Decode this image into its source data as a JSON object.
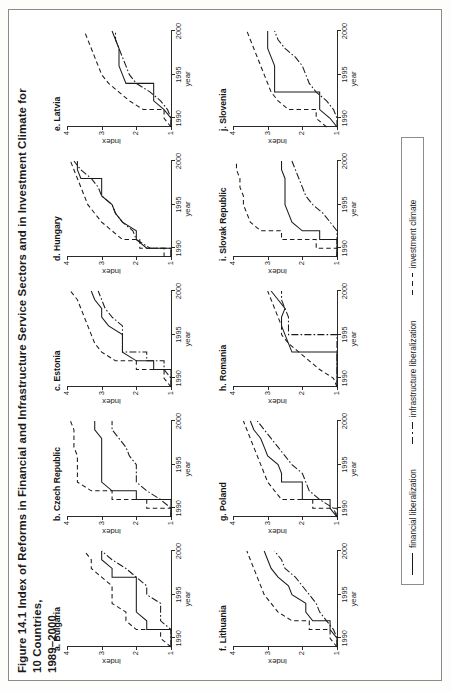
{
  "figure": {
    "title_line1": "Figure 14.1  Index of Reforms in Financial and Infrastructure Service Sectors and in Investment Climate for 10 Countries,",
    "title_line2": "1989–2000"
  },
  "legend": {
    "items": [
      {
        "label": "financial liberalization",
        "style": "solid",
        "icon": "line-solid-icon"
      },
      {
        "label": "infrastructure liberalization",
        "style": "dashdot",
        "icon": "line-dashdot-icon"
      },
      {
        "label": "investment climate",
        "style": "dash",
        "icon": "line-dashed-icon"
      }
    ]
  },
  "chart_data": {
    "type": "line",
    "title": "Figure 14.1  Index of Reforms in Financial and Infrastructure Service Sectors and in Investment Climate for 10 Countries, 1989–2000",
    "xlabel": "year",
    "ylabel": "index",
    "xlim": [
      1989,
      2000
    ],
    "ylim": [
      1,
      4
    ],
    "xticks": [
      1990,
      1995,
      2000
    ],
    "xtick_labels": [
      "1990",
      "1995",
      "2000"
    ],
    "yticks": [
      1,
      2,
      3,
      4
    ],
    "ytick_labels": [
      "1",
      "2",
      "3",
      "4"
    ],
    "grid": false,
    "legend_position": "bottom",
    "x": [
      1989,
      1990,
      1991,
      1992,
      1993,
      1994,
      1995,
      1996,
      1997,
      1998,
      1999,
      2000
    ],
    "panels": [
      {
        "key": "a",
        "label": "a. Bulgaria",
        "series": [
          {
            "name": "financial liberalization",
            "style": "solid",
            "values": [
              1.0,
              1.0,
              1.7,
              1.7,
              2.0,
              2.0,
              2.0,
              2.0,
              2.7,
              2.7,
              3.0,
              3.0
            ]
          },
          {
            "name": "infrastructure liberalization",
            "style": "dashdot",
            "values": [
              1.0,
              1.0,
              1.0,
              1.3,
              1.3,
              1.3,
              1.7,
              1.7,
              2.0,
              2.3,
              2.7,
              3.0
            ]
          },
          {
            "name": "investment climate",
            "style": "dash",
            "values": [
              1.0,
              1.3,
              2.0,
              2.3,
              2.3,
              2.7,
              2.7,
              2.7,
              3.0,
              3.3,
              3.3,
              3.5
            ]
          }
        ]
      },
      {
        "key": "b",
        "label": "b. Czech Republic",
        "series": [
          {
            "name": "financial liberalization",
            "style": "solid",
            "values": [
              1.0,
              1.0,
              2.0,
              2.7,
              3.0,
              3.0,
              3.0,
              3.0,
              3.0,
              3.0,
              3.2,
              3.2
            ]
          },
          {
            "name": "infrastructure liberalization",
            "style": "dashdot",
            "values": [
              1.0,
              1.0,
              1.3,
              1.7,
              2.0,
              2.0,
              2.0,
              2.2,
              2.3,
              2.5,
              2.7,
              2.7
            ]
          },
          {
            "name": "investment climate",
            "style": "dash",
            "values": [
              1.0,
              1.7,
              2.7,
              3.3,
              3.7,
              3.7,
              3.7,
              3.7,
              3.8,
              3.8,
              3.8,
              3.9
            ]
          }
        ]
      },
      {
        "key": "c",
        "label": "c. Estonia",
        "series": [
          {
            "name": "financial liberalization",
            "style": "solid",
            "values": [
              1.0,
              1.0,
              1.5,
              2.0,
              2.4,
              2.4,
              2.4,
              2.8,
              3.0,
              3.0,
              3.2,
              3.3
            ]
          },
          {
            "name": "infrastructure liberalization",
            "style": "dashdot",
            "values": [
              1.0,
              1.0,
              1.2,
              1.7,
              2.4,
              2.4,
              2.4,
              2.4,
              2.7,
              2.9,
              3.0,
              3.1
            ]
          },
          {
            "name": "investment climate",
            "style": "dash",
            "values": [
              1.0,
              1.2,
              2.0,
              2.6,
              3.0,
              3.2,
              3.3,
              3.4,
              3.5,
              3.6,
              3.7,
              3.9
            ]
          }
        ]
      },
      {
        "key": "d",
        "label": "d. Hungary",
        "series": [
          {
            "name": "financial liberalization",
            "style": "solid",
            "values": [
              1.0,
              1.7,
              2.0,
              2.0,
              2.4,
              2.6,
              2.7,
              3.0,
              3.0,
              3.6,
              3.7,
              3.7
            ]
          },
          {
            "name": "infrastructure liberalization",
            "style": "dashdot",
            "values": [
              1.0,
              1.6,
              2.0,
              2.1,
              2.4,
              2.6,
              2.7,
              3.0,
              3.1,
              3.3,
              3.6,
              3.8
            ]
          },
          {
            "name": "investment climate",
            "style": "dash",
            "values": [
              1.2,
              1.9,
              2.4,
              2.7,
              3.0,
              3.2,
              3.4,
              3.5,
              3.6,
              3.7,
              3.8,
              3.9
            ]
          }
        ]
      },
      {
        "key": "e",
        "label": "e. Latvia",
        "series": [
          {
            "name": "financial liberalization",
            "style": "solid",
            "values": [
              1.0,
              1.0,
              1.2,
              1.5,
              1.5,
              2.3,
              2.4,
              2.5,
              2.5,
              2.5,
              2.6,
              2.7
            ]
          },
          {
            "name": "infrastructure liberalization",
            "style": "dashdot",
            "values": [
              1.0,
              1.0,
              1.1,
              1.3,
              1.6,
              2.0,
              2.2,
              2.3,
              2.4,
              2.5,
              2.6,
              2.6
            ]
          },
          {
            "name": "investment climate",
            "style": "dash",
            "values": [
              1.0,
              1.2,
              1.8,
              2.2,
              2.5,
              2.8,
              3.0,
              3.1,
              3.2,
              3.3,
              3.4,
              3.5
            ]
          }
        ]
      },
      {
        "key": "f",
        "label": "f. Lithuania",
        "series": [
          {
            "name": "financial liberalization",
            "style": "solid",
            "values": [
              1.0,
              1.0,
              1.2,
              1.7,
              1.9,
              1.9,
              2.3,
              2.4,
              2.7,
              2.9,
              3.0,
              3.1
            ]
          },
          {
            "name": "infrastructure liberalization",
            "style": "dashdot",
            "values": [
              1.0,
              1.0,
              1.1,
              1.3,
              1.5,
              1.6,
              1.8,
              2.0,
              2.2,
              2.5,
              2.6,
              2.8
            ]
          },
          {
            "name": "investment climate",
            "style": "dash",
            "values": [
              1.0,
              1.2,
              1.8,
              2.3,
              2.7,
              2.9,
              3.1,
              3.2,
              3.3,
              3.4,
              3.5,
              3.6
            ]
          }
        ]
      },
      {
        "key": "g",
        "label": "g. Poland",
        "series": [
          {
            "name": "financial liberalization",
            "style": "solid",
            "values": [
              1.0,
              1.2,
              2.0,
              2.0,
              2.6,
              2.6,
              2.7,
              3.0,
              3.1,
              3.2,
              3.4,
              3.5
            ]
          },
          {
            "name": "infrastructure liberalization",
            "style": "dashdot",
            "values": [
              1.0,
              1.1,
              1.5,
              1.8,
              1.9,
              2.0,
              2.3,
              2.5,
              2.7,
              2.9,
              3.1,
              3.3
            ]
          },
          {
            "name": "investment climate",
            "style": "dash",
            "values": [
              1.0,
              1.7,
              2.6,
              2.8,
              3.0,
              3.1,
              3.2,
              3.3,
              3.4,
              3.5,
              3.6,
              3.7
            ]
          }
        ]
      },
      {
        "key": "h",
        "label": "h. Romania",
        "series": [
          {
            "name": "financial liberalization",
            "style": "solid",
            "values": [
              1.0,
              1.0,
              1.0,
              1.0,
              2.3,
              2.4,
              2.5,
              2.6,
              2.6,
              2.5,
              2.7,
              2.9
            ]
          },
          {
            "name": "infrastructure liberalization",
            "style": "dashdot",
            "values": [
              1.0,
              1.0,
              1.0,
              1.0,
              1.0,
              1.0,
              2.4,
              2.4,
              2.4,
              2.5,
              2.6,
              2.6
            ]
          },
          {
            "name": "investment climate",
            "style": "dash",
            "values": [
              1.0,
              1.1,
              1.5,
              1.8,
              2.1,
              2.4,
              2.6,
              2.6,
              2.7,
              2.8,
              2.9,
              3.0
            ]
          }
        ]
      },
      {
        "key": "i",
        "label": "i. Slovak Republic",
        "series": [
          {
            "name": "financial liberalization",
            "style": "solid",
            "values": [
              1.0,
              1.0,
              1.5,
              2.0,
              2.3,
              2.4,
              2.5,
              2.5,
              2.5,
              2.5,
              2.6,
              2.6
            ]
          },
          {
            "name": "infrastructure liberalization",
            "style": "dashdot",
            "values": [
              1.0,
              1.0,
              1.0,
              1.0,
              1.2,
              1.4,
              1.7,
              1.9,
              2.0,
              2.1,
              2.2,
              2.3
            ]
          },
          {
            "name": "investment climate",
            "style": "dash",
            "values": [
              1.0,
              1.6,
              2.6,
              3.2,
              3.5,
              3.6,
              3.7,
              3.7,
              3.8,
              3.8,
              3.9,
              3.9
            ]
          }
        ]
      },
      {
        "key": "j",
        "label": "j. Slovenia",
        "series": [
          {
            "name": "financial liberalization",
            "style": "solid",
            "values": [
              1.0,
              1.2,
              1.5,
              1.5,
              2.8,
              2.8,
              2.8,
              2.8,
              2.9,
              3.0,
              3.0,
              3.0
            ]
          },
          {
            "name": "infrastructure liberalization",
            "style": "dashdot",
            "values": [
              1.0,
              1.0,
              1.1,
              1.3,
              1.6,
              1.8,
              1.9,
              2.0,
              2.2,
              2.5,
              2.7,
              2.8
            ]
          },
          {
            "name": "investment climate",
            "style": "dash",
            "values": [
              1.3,
              1.6,
              2.4,
              2.7,
              2.9,
              3.0,
              3.1,
              3.2,
              3.3,
              3.4,
              3.5,
              3.6
            ]
          }
        ]
      }
    ]
  }
}
